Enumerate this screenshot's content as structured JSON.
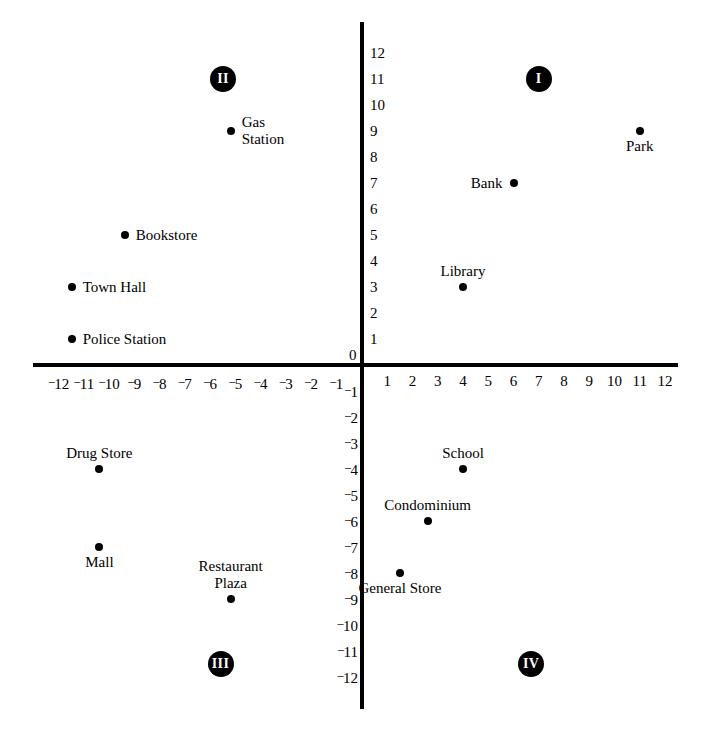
{
  "chart_data": {
    "type": "scatter",
    "title": "",
    "xlabel": "",
    "ylabel": "",
    "xlim": [
      -12,
      12
    ],
    "ylim": [
      -12,
      12
    ],
    "grid": false,
    "legend": "none",
    "x_ticks": [
      "-12",
      "-11",
      "-10",
      "-9",
      "-8",
      "-7",
      "-6",
      "-5",
      "-4",
      "-3",
      "-2",
      "-1",
      "1",
      "2",
      "3",
      "4",
      "5",
      "6",
      "7",
      "8",
      "9",
      "10",
      "11",
      "12"
    ],
    "y_ticks": [
      "12",
      "11",
      "10",
      "9",
      "8",
      "7",
      "6",
      "5",
      "4",
      "3",
      "2",
      "1",
      "-1",
      "-2",
      "-3",
      "-4",
      "-5",
      "-6",
      "-7",
      "-8",
      "-9",
      "-10",
      "-11",
      "-12"
    ],
    "origin_label": "0",
    "quadrants": [
      {
        "name": "I",
        "label": "I",
        "x": 7,
        "y": 11
      },
      {
        "name": "II",
        "label": "II",
        "x": -5.5,
        "y": 11
      },
      {
        "name": "III",
        "label": "III",
        "x": -5.6,
        "y": -11.5
      },
      {
        "name": "IV",
        "label": "IV",
        "x": 6.7,
        "y": -11.5
      }
    ],
    "points": [
      {
        "label": "Park",
        "x": 11,
        "y": 9,
        "label_pos": "below"
      },
      {
        "label": "Bank",
        "x": 6,
        "y": 7,
        "label_pos": "left"
      },
      {
        "label": "Library",
        "x": 4,
        "y": 3,
        "label_pos": "above"
      },
      {
        "label": "Gas\nStation",
        "x": -5.2,
        "y": 9,
        "label_pos": "right"
      },
      {
        "label": "Bookstore",
        "x": -9.4,
        "y": 5,
        "label_pos": "right"
      },
      {
        "label": "Town Hall",
        "x": -11.5,
        "y": 3,
        "label_pos": "right"
      },
      {
        "label": "Police Station",
        "x": -11.5,
        "y": 1,
        "label_pos": "right"
      },
      {
        "label": "Drug Store",
        "x": -10.4,
        "y": -4,
        "label_pos": "above"
      },
      {
        "label": "Mall",
        "x": -10.4,
        "y": -7,
        "label_pos": "below"
      },
      {
        "label": "Restaurant\nPlaza",
        "x": -5.2,
        "y": -9,
        "label_pos": "above"
      },
      {
        "label": "School",
        "x": 4,
        "y": -4,
        "label_pos": "above"
      },
      {
        "label": "Condominium",
        "x": 2.6,
        "y": -6,
        "label_pos": "above"
      },
      {
        "label": "General Store",
        "x": 1.5,
        "y": -8,
        "label_pos": "below"
      }
    ],
    "colors": {
      "point": "#000000",
      "axis": "#000000",
      "background": "#ffffff",
      "quadrant_badge": "#000000"
    }
  }
}
